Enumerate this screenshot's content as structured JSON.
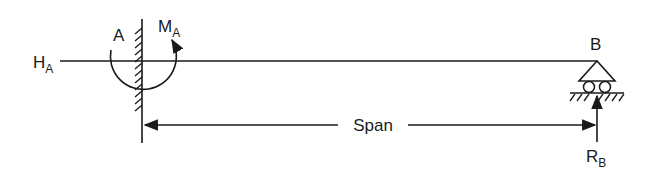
{
  "diagram": {
    "type": "propped cantilever beam",
    "colors": {
      "stroke": "#1a1a1a",
      "background": "#ffffff"
    },
    "labels": {
      "horizontal_reaction": {
        "main": "H",
        "sub": "A"
      },
      "fixed_end": "A",
      "moment": {
        "main": "M",
        "sub": "A"
      },
      "roller_end": "B",
      "span": "Span",
      "vertical_reaction": {
        "main": "R",
        "sub": "B"
      }
    },
    "supports": [
      {
        "name": "A",
        "kind": "fixed"
      },
      {
        "name": "B",
        "kind": "roller"
      }
    ]
  }
}
